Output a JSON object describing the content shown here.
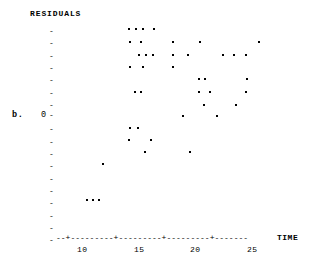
{
  "panel": {
    "label": "b."
  },
  "axes": {
    "y_title": "RESIDUALS",
    "y_zero_label": "0",
    "y_tick_glyph": "-",
    "y_tick_count": 18,
    "x_title": "TIME",
    "x_axis_line": "--+---------+---------+---------+-------",
    "x_tick_labels": [
      "10",
      "15",
      "20",
      "25"
    ]
  },
  "chart_data": {
    "type": "scatter",
    "title": "",
    "xlabel": "TIME",
    "ylabel": "RESIDUALS",
    "xlim": [
      8.5,
      28.5
    ],
    "ylim": [
      -9,
      9
    ],
    "grid": false,
    "legend": null,
    "marker": "*",
    "note": "Residual plot: residuals versus TIME. Horizontal reference at 0 marked by the '0-' tick on the vertical axis.",
    "x_ticks": [
      10,
      15,
      20,
      25
    ],
    "y_ticks_labeled": [
      0
    ],
    "points": [
      {
        "x": 14.6,
        "y": 7,
        "px": 128,
        "py": 28
      },
      {
        "x": 15.3,
        "y": 7,
        "px": 135,
        "py": 28
      },
      {
        "x": 16.0,
        "y": 7,
        "px": 142,
        "py": 28
      },
      {
        "x": 17.1,
        "y": 7,
        "px": 153,
        "py": 28
      },
      {
        "x": 14.7,
        "y": 6,
        "px": 129,
        "py": 41
      },
      {
        "x": 15.8,
        "y": 6,
        "px": 140,
        "py": 41
      },
      {
        "x": 19.0,
        "y": 6,
        "px": 172,
        "py": 41
      },
      {
        "x": 21.6,
        "y": 6,
        "px": 199,
        "py": 41
      },
      {
        "x": 27.5,
        "y": 6,
        "px": 258,
        "py": 41
      },
      {
        "x": 15.6,
        "y": 5,
        "px": 138,
        "py": 54
      },
      {
        "x": 16.3,
        "y": 5,
        "px": 145,
        "py": 54
      },
      {
        "x": 17.0,
        "y": 5,
        "px": 152,
        "py": 54
      },
      {
        "x": 19.0,
        "y": 5,
        "px": 172,
        "py": 54
      },
      {
        "x": 20.5,
        "y": 5,
        "px": 187,
        "py": 54
      },
      {
        "x": 23.9,
        "y": 5,
        "px": 222,
        "py": 54
      },
      {
        "x": 25.0,
        "y": 5,
        "px": 233,
        "py": 54
      },
      {
        "x": 26.2,
        "y": 5,
        "px": 245,
        "py": 54
      },
      {
        "x": 14.7,
        "y": 4,
        "px": 129,
        "py": 66
      },
      {
        "x": 16.0,
        "y": 4,
        "px": 142,
        "py": 66
      },
      {
        "x": 19.0,
        "y": 4,
        "px": 172,
        "py": 66
      },
      {
        "x": 21.5,
        "y": 3,
        "px": 198,
        "py": 78
      },
      {
        "x": 22.1,
        "y": 3,
        "px": 204,
        "py": 78
      },
      {
        "x": 26.3,
        "y": 3,
        "px": 246,
        "py": 78
      },
      {
        "x": 15.2,
        "y": 2,
        "px": 134,
        "py": 91
      },
      {
        "x": 15.8,
        "y": 2,
        "px": 140,
        "py": 91
      },
      {
        "x": 21.5,
        "y": 2,
        "px": 198,
        "py": 91
      },
      {
        "x": 22.6,
        "y": 2,
        "px": 209,
        "py": 91
      },
      {
        "x": 26.2,
        "y": 2,
        "px": 245,
        "py": 91
      },
      {
        "x": 22.0,
        "y": 1,
        "px": 203,
        "py": 104
      },
      {
        "x": 25.2,
        "y": 1,
        "px": 235,
        "py": 104
      },
      {
        "x": 19.9,
        "y": 0,
        "px": 182,
        "py": 115
      },
      {
        "x": 23.3,
        "y": 0,
        "px": 216,
        "py": 115
      },
      {
        "x": 14.6,
        "y": -1,
        "px": 129,
        "py": 127
      },
      {
        "x": 15.4,
        "y": -1,
        "px": 137,
        "py": 127
      },
      {
        "x": 14.5,
        "y": -2,
        "px": 128,
        "py": 139
      },
      {
        "x": 16.8,
        "y": -2,
        "px": 150,
        "py": 139
      },
      {
        "x": 16.2,
        "y": -3,
        "px": 144,
        "py": 151
      },
      {
        "x": 20.7,
        "y": -3,
        "px": 189,
        "py": 151
      },
      {
        "x": 11.6,
        "y": -4,
        "px": 102,
        "py": 163
      },
      {
        "x": 10.0,
        "y": -7,
        "px": 86,
        "py": 199
      },
      {
        "x": 10.6,
        "y": -7,
        "px": 92,
        "py": 199
      },
      {
        "x": 11.3,
        "y": -7,
        "px": 98,
        "py": 199
      }
    ]
  }
}
